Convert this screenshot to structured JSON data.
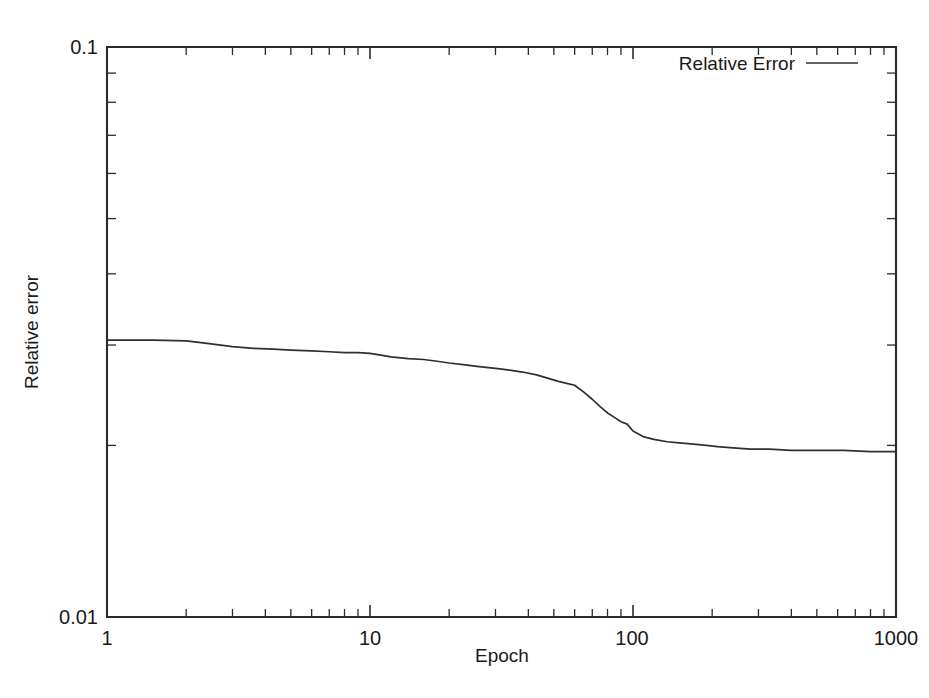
{
  "chart_data": {
    "type": "line",
    "title": "",
    "xlabel": "Epoch",
    "ylabel": "Relative error",
    "xscale": "log",
    "yscale": "log",
    "xlim": [
      1,
      1000
    ],
    "ylim": [
      0.01,
      0.1
    ],
    "grid": false,
    "legend_position": "top-right",
    "xticks": [
      1,
      10,
      100,
      1000
    ],
    "xticklabels": [
      "1",
      "10",
      "100",
      "1000"
    ],
    "yticks": [
      0.01,
      0.1
    ],
    "yticklabels": [
      "0.01",
      "0.1"
    ],
    "series": [
      {
        "name": "Relative Error",
        "color": "#2f2f2f",
        "x": [
          1,
          1.5,
          2,
          2.4,
          3,
          3.6,
          4.3,
          5,
          6,
          7,
          8,
          9,
          10,
          11,
          12,
          14,
          16,
          18,
          20,
          23,
          26,
          30,
          34,
          38,
          43,
          48,
          52,
          56,
          60,
          65,
          70,
          75,
          80,
          85,
          90,
          95,
          100,
          110,
          120,
          135,
          150,
          170,
          190,
          210,
          240,
          280,
          330,
          400,
          500,
          630,
          800,
          1000
        ],
        "y": [
          0.0306,
          0.0306,
          0.0305,
          0.0302,
          0.0298,
          0.0296,
          0.0295,
          0.0294,
          0.0293,
          0.0292,
          0.0291,
          0.0291,
          0.029,
          0.0288,
          0.0286,
          0.0284,
          0.0283,
          0.0281,
          0.0279,
          0.0277,
          0.0275,
          0.0273,
          0.0271,
          0.0269,
          0.0266,
          0.0262,
          0.0259,
          0.0257,
          0.0255,
          0.0248,
          0.0241,
          0.0234,
          0.0228,
          0.0224,
          0.022,
          0.0218,
          0.0212,
          0.0207,
          0.0205,
          0.0203,
          0.0202,
          0.0201,
          0.02,
          0.0199,
          0.0198,
          0.0197,
          0.0197,
          0.0196,
          0.0196,
          0.0196,
          0.0195,
          0.0195
        ]
      }
    ]
  },
  "axes": {
    "y_title": "Relative error",
    "x_title": "Epoch",
    "y_top_label": "0.1",
    "y_bottom_label": "0.01",
    "x_labels": [
      "1",
      "10",
      "100",
      "1000"
    ]
  },
  "legend": {
    "entries": [
      {
        "label": "Relative Error"
      }
    ]
  }
}
